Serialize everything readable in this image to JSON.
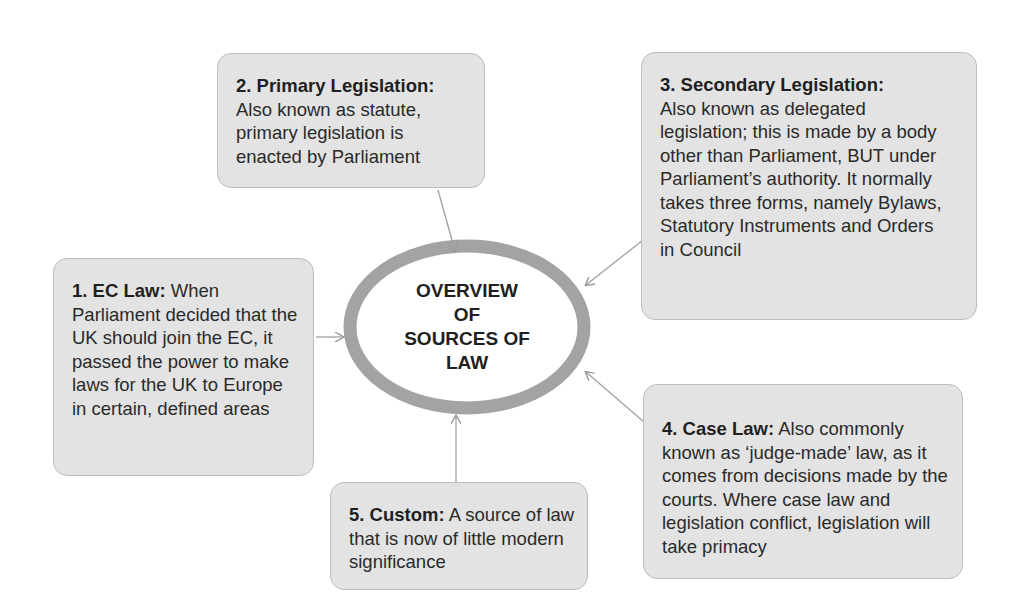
{
  "diagram": {
    "center": {
      "title": "OVERVIEW\nOF\nSOURCES OF\nLAW"
    },
    "nodes": [
      {
        "id": 1,
        "heading": "1. EC Law:",
        "body": "When Parliament decided that the UK should join the EC, it passed the power to make laws for the UK to Europe in certain, defined areas"
      },
      {
        "id": 2,
        "heading": "2. Primary Legislation:",
        "body": "Also known as statute, primary legislation is enacted by Parliament"
      },
      {
        "id": 3,
        "heading": "3. Secondary Legislation:",
        "body": "Also known as delegated legislation; this is made by a body other than Parliament, BUT under Parliament’s authority. It normally takes three forms, namely Bylaws, Statutory Instruments and Orders in Council"
      },
      {
        "id": 4,
        "heading": "4. Case Law:",
        "body": "Also commonly known as ‘judge-made’ law, as it comes from decisions made by the courts. Where case law and legislation conflict, legislation will take primacy"
      },
      {
        "id": 5,
        "heading": "5. Custom:",
        "body": "A source of law that is now of little modern significance"
      }
    ],
    "colors": {
      "box_fill": "#e3e3e3",
      "box_border": "#bdbdbd",
      "ring": "#9a9a9a",
      "arrow": "#a0a0a0"
    }
  }
}
